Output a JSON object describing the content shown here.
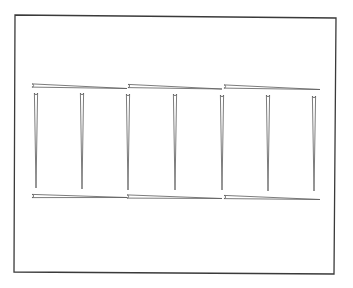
{
  "diagram": {
    "title": "",
    "colors": {
      "background": "#ffffff",
      "frame_stroke": "#3a3a3a",
      "needle_stroke": "#5a5a5a",
      "needle_fill": "#ffffff"
    },
    "frame": {
      "points": [
        [
          15,
          15
        ],
        [
          336,
          18
        ],
        [
          334,
          274
        ],
        [
          14,
          272
        ]
      ]
    },
    "needle_width": 3.2,
    "horizontal_needles_top": [
      {
        "x1": 32,
        "y1": 85.5,
        "x2": 127,
        "y2": 88.5
      },
      {
        "x1": 128,
        "y1": 86,
        "x2": 222,
        "y2": 89
      },
      {
        "x1": 224,
        "y1": 86.5,
        "x2": 320,
        "y2": 89.5
      }
    ],
    "vertical_needles": [
      {
        "x": 36,
        "y1": 93,
        "y2": 188
      },
      {
        "x": 82,
        "y1": 93,
        "y2": 189
      },
      {
        "x": 128,
        "y1": 94,
        "y2": 190
      },
      {
        "x": 175,
        "y1": 94,
        "y2": 190
      },
      {
        "x": 222,
        "y1": 95,
        "y2": 190
      },
      {
        "x": 268,
        "y1": 95,
        "y2": 191
      },
      {
        "x": 314,
        "y1": 96,
        "y2": 191
      }
    ],
    "horizontal_needles_bottom": [
      {
        "x1": 32,
        "y1": 196,
        "x2": 127,
        "y2": 197.5
      },
      {
        "x1": 127,
        "y1": 196.5,
        "x2": 222,
        "y2": 198.5
      },
      {
        "x1": 224,
        "y1": 197,
        "x2": 320,
        "y2": 199.5
      }
    ]
  }
}
